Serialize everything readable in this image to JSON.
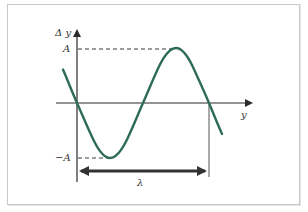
{
  "diagram": {
    "labels": {
      "y_axis": "Δ y",
      "x_axis": "y",
      "amplitude_pos": "A",
      "amplitude_neg": "−A",
      "wavelength": "λ"
    },
    "colors": {
      "curve": "#2e6b5a",
      "axes": "#2b2b2b",
      "dashed": "#3a3a3a",
      "lambda_arrow": "#333333",
      "frame": "#c8c8c8"
    },
    "curve": {
      "type": "sine",
      "description": "negative sine over one full wavelength, starting at origin going down, min at -A, max at +A, returns to zero at λ"
    }
  }
}
